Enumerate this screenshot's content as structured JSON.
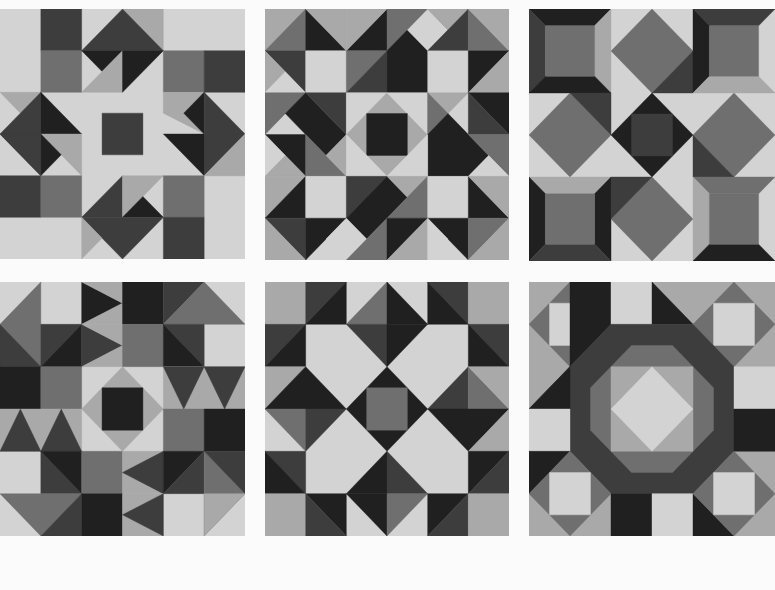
{
  "palette": {
    "light": "#d3d3d3",
    "midlight": "#a9a9a9",
    "mid": "#6f6f6f",
    "dark": "#3d3d3d",
    "darkest": "#202020",
    "page": "#fbfbfb"
  },
  "blocks": [
    {
      "name": "block-1-star-with-pinwheel-arrows",
      "box": {
        "x": 0,
        "y": 9,
        "w": 245,
        "h": 250
      },
      "bg": "light",
      "shapes": [
        [
          "dark",
          "1,0 2,0 2,1 1,1"
        ],
        [
          "mid",
          "1,1 2,1 2,2 1,2"
        ],
        [
          "midlight",
          "3,0 4,0 4,1"
        ],
        [
          "dark",
          "3,0 4,1 2,1"
        ],
        [
          "darkest",
          "2,1 3,1 2.5,1.5"
        ],
        [
          "midlight",
          "2,2 3,1 3,2"
        ],
        [
          "darkest",
          "3,1 4,1 3,2"
        ],
        [
          "mid",
          "4,1 5,1 5,2 4,2"
        ],
        [
          "dark",
          "5,1 6,1 6,2 5,2"
        ],
        [
          "midlight",
          "0,2 1,2 0.5,2.5"
        ],
        [
          "dark",
          "1,2 0,3 1,4"
        ],
        [
          "darkest",
          "1,2 2,3 1,3"
        ],
        [
          "midlight",
          "1,3 2,3 2,4"
        ],
        [
          "darkest",
          "1,3 1.5,3.5 1,4"
        ],
        [
          "dark",
          "0,3 1,3 1,4"
        ],
        [
          "midlight",
          "4,2 5,2 5,3 4,2.5"
        ],
        [
          "darkest",
          "5,2 5,3 4.5,2.5"
        ],
        [
          "dark",
          "5,2 6,3 5,4"
        ],
        [
          "darkest",
          "4,3 5,3 5,4"
        ],
        [
          "midlight",
          "5,4 6,4 5,4"
        ],
        [
          "midlight",
          "5,4 6,3 6,4"
        ],
        [
          "dark",
          "2.5,2.5 3.5,2.5 3.5,3.5 2.5,3.5"
        ],
        [
          "dark",
          "0,4 1,4 1,5 0,5"
        ],
        [
          "mid",
          "1,4 2,4 2,5 1,5"
        ],
        [
          "dark",
          "3,4 2,5 3,5"
        ],
        [
          "midlight",
          "3,4 4,4 3,5"
        ],
        [
          "darkest",
          "3.5,4.5 4,5 3,5"
        ],
        [
          "dark",
          "2,5 4,5 3,6"
        ],
        [
          "midlight",
          "2,5 2.5,5.5 2,6"
        ],
        [
          "mid",
          "4,4 5,4 5,5 4,5"
        ],
        [
          "dark",
          "4,5 5,5 5,6 4,6"
        ]
      ]
    },
    {
      "name": "block-2-diagonal-star",
      "box": {
        "x": 265,
        "y": 9,
        "w": 244,
        "h": 251
      },
      "bg": "light",
      "shapes": [
        [
          "midlight",
          "0,0 1,0 0,1"
        ],
        [
          "mid",
          "0,1 1,0 1,1"
        ],
        [
          "darkest",
          "1,0 2,1 1,1"
        ],
        [
          "midlight",
          "1,0 2,0 2,1"
        ],
        [
          "darkest",
          "2,1 3,0 3,1"
        ],
        [
          "midlight",
          "2,0 3,0 2,1"
        ],
        [
          "mid",
          "3,0 4,0 3,1"
        ],
        [
          "darkest",
          "3,1 4,0 5,1 4,2 3,2"
        ],
        [
          "light",
          "3.5,0.5 4,0 4.5,0.5 4,1"
        ],
        [
          "midlight",
          "4,0 5,0 5,1"
        ],
        [
          "dark",
          "4,1 5,0 5,1"
        ],
        [
          "mid",
          "5,0 6,1 5,1"
        ],
        [
          "midlight",
          "5,0 6,0 6,1"
        ],
        [
          "dark",
          "0,1 1,1 1,2"
        ],
        [
          "midlight",
          "0,1 0.5,1.5 0,2"
        ],
        [
          "light",
          "0,2 0.5,1.5 1,2 0.5,2.5"
        ],
        [
          "light",
          "1,1 2,1 2,2 1,2"
        ],
        [
          "mid",
          "2,1 3,1 2,2"
        ],
        [
          "dark",
          "2,2 3,1 3,2"
        ],
        [
          "light",
          "4,1 5,1 5,2 4,2"
        ],
        [
          "darkest",
          "5,1 6,1 5,2"
        ],
        [
          "midlight",
          "5,2 6,1 6,2"
        ],
        [
          "mid",
          "0,2 1,2 0,3"
        ],
        [
          "darkest",
          "0.5,2.5 1,2 2,3 1.5,3.5 1,3"
        ],
        [
          "dark",
          "1,2 2,2 2,3"
        ],
        [
          "light",
          "2,2 3,2 2,3"
        ],
        [
          "midlight",
          "2,3 3,2 4,3 3,4"
        ],
        [
          "light",
          "3,2 4,2 4,3"
        ],
        [
          "darkest",
          "2.5,2.5 3.5,2.5 3.5,3.5 2.5,3.5"
        ],
        [
          "midlight",
          "4,2 5,2 4,3"
        ],
        [
          "mid",
          "4,2 4.5,2.5 4,3"
        ],
        [
          "darkest",
          "5,2 6,2 6,3"
        ],
        [
          "darkest",
          "4,3 4.5,2.5 5.5,3.5 5,4 4,4"
        ],
        [
          "dark",
          "5,2 6,3 5,3"
        ],
        [
          "mid",
          "5,3 6,3 6,4"
        ],
        [
          "darkest",
          "0,3 1,3 1,4"
        ],
        [
          "light",
          "0,3 0.5,3.5 0,4"
        ],
        [
          "midlight",
          "0,4 0.5,3.5 1,4"
        ],
        [
          "mid",
          "1,3 2,4 1,4"
        ],
        [
          "midlight",
          "1.5,3.5 2,3 2,4"
        ],
        [
          "light",
          "2,3 3,4 2,4"
        ],
        [
          "light",
          "3,4 4,3 4,4"
        ],
        [
          "light",
          "5,4 5.5,3.5 6,4 5.5,4.5"
        ],
        [
          "midlight",
          "0,4 1,4 0,5"
        ],
        [
          "darkest",
          "0,5 1,4 1,5"
        ],
        [
          "light",
          "1,4 2,4 2,5 1,5"
        ],
        [
          "dark",
          "2,4 3,4 2,5"
        ],
        [
          "darkest",
          "2,5 3,4 3.5,4.5 3,5 2.5,5.5"
        ],
        [
          "midlight",
          "3,4 4,4 4,5"
        ],
        [
          "mid",
          "3,5 4,4 4,5"
        ],
        [
          "light",
          "4,4 5,4 5,5 4,5"
        ],
        [
          "darkest",
          "5,4 6,5 5,5"
        ],
        [
          "midlight",
          "5,4 6,4 6,5"
        ],
        [
          "dark",
          "0,5 1,5 1,6"
        ],
        [
          "midlight",
          "0,5 1,6 0,6"
        ],
        [
          "darkest",
          "1,5 2,5 1,6"
        ],
        [
          "light",
          "2,5 2.5,5.5 2,6 1.5,5.5"
        ],
        [
          "mid",
          "2,6 3,5 3,6"
        ],
        [
          "darkest",
          "3,5 4,5 3,6"
        ],
        [
          "midlight",
          "4,5 4,6 3,6"
        ],
        [
          "darkest",
          "4,5 5,5 5,6"
        ],
        [
          "light",
          "4,5 4.5,5.5 4,6"
        ],
        [
          "mid",
          "5,5 6,5 5,6"
        ],
        [
          "midlight",
          "5,6 6,5 6,6"
        ]
      ]
    },
    {
      "name": "block-3-framed-squares-and-diamonds",
      "box": {
        "x": 529,
        "y": 9,
        "w": 246,
        "h": 252
      },
      "bg": "light",
      "shapes": [
        [
          "darkest",
          "0,0 2,0 1.6,0.4 0.4,0.4"
        ],
        [
          "dark",
          "0,0 0.4,0.4 0.4,1.6 0,2"
        ],
        [
          "midlight",
          "2,0 2,2 1.6,1.6 1.6,0.4"
        ],
        [
          "darkest",
          "0,2 0.4,1.6 1.6,1.6 2,2"
        ],
        [
          "mid",
          "0.4,0.4 1.6,0.4 1.6,1.6 0.4,1.6"
        ],
        [
          "mid",
          "3,0 4,1 3,2 2,1"
        ],
        [
          "dark",
          "3,2 4,1 4,2"
        ],
        [
          "dark",
          "4,0 6,0 5.6,0.4 4.4,0.4"
        ],
        [
          "darkest",
          "4,0 4.4,0.4 4.4,1.6 4,2"
        ],
        [
          "midlight",
          "4,2 4.4,1.6 5.6,1.6 6,2"
        ],
        [
          "mid",
          "4.4,0.4 5.6,0.4 5.6,1.6 4.4,1.6"
        ],
        [
          "mid",
          "1,2 2,3 1,4 0,3"
        ],
        [
          "dark",
          "1,2 2,2 2,3"
        ],
        [
          "darkest",
          "3,2 4,3 3,4 2,3"
        ],
        [
          "dark",
          "2.5,2.5 3.5,2.5 3.5,3.5 2.5,3.5"
        ],
        [
          "mid",
          "5,2 6,3 5,4 4,3"
        ],
        [
          "dark",
          "4,3 5,4 4,4"
        ],
        [
          "midlight",
          "0,4 2,4 1.6,4.4 0.4,4.4"
        ],
        [
          "darkest",
          "0,4 0.4,4.4 0.4,5.6 0,6"
        ],
        [
          "darkest",
          "2,4 2,6 1.6,5.6 1.6,4.4"
        ],
        [
          "dark",
          "0,6 0.4,5.6 1.6,5.6 2,6"
        ],
        [
          "mid",
          "0.4,4.4 1.6,4.4 1.6,5.6 0.4,5.6"
        ],
        [
          "mid",
          "3,4 4,5 3,6 2,5"
        ],
        [
          "dark",
          "2,4 3,4 2,5"
        ],
        [
          "mid",
          "4,4 6,4 5.6,4.4 4.4,4.4"
        ],
        [
          "midlight",
          "4,4 4.4,4.4 4.4,5.6 4,6"
        ],
        [
          "darkest",
          "4,6 4.4,5.6 5.6,5.6 6,6"
        ],
        [
          "mid",
          "4.4,4.4 5.6,4.4 5.6,5.6 4.4,5.6"
        ]
      ]
    },
    {
      "name": "block-4-flying-geese-sampler",
      "box": {
        "x": 0,
        "y": 282,
        "w": 245,
        "h": 254
      },
      "bg": "light",
      "shapes": [
        [
          "mid",
          "1,0 0,1 1,2"
        ],
        [
          "darkest",
          "2,0 3,0.5 2,1"
        ],
        [
          "midlight",
          "2,0 3,0 3,0.5"
        ],
        [
          "midlight",
          "2,1 3,0.5 3,1"
        ],
        [
          "darkest",
          "3,0 4,0 4,1 3,1"
        ],
        [
          "dark",
          "4,0 5,0 4,1"
        ],
        [
          "mid",
          "4,1 5,0 6,1"
        ],
        [
          "dark",
          "0,1 1,2 0,2"
        ],
        [
          "dark",
          "1,1 2,1 1,2"
        ],
        [
          "darkest",
          "1,2 2,1 2,2"
        ],
        [
          "dark",
          "2,1 3,1.5 2,2"
        ],
        [
          "midlight",
          "2,1 3,1 3,1.5"
        ],
        [
          "midlight",
          "2,2 3,1.5 3,2"
        ],
        [
          "mid",
          "3,1 4,1 4,2 3,2"
        ],
        [
          "dark",
          "4,1 5,1 5,2"
        ],
        [
          "darkest",
          "4,1 5,2 4,2"
        ],
        [
          "darkest",
          "0,2 1,2 1,3 0,3"
        ],
        [
          "mid",
          "1,2 2,2 2,3 1,3"
        ],
        [
          "midlight",
          "2.5,2.5 3,2 4,3 3,4 2,3"
        ],
        [
          "darkest",
          "2.5,2.5 3.5,2.5 3.5,3.5 2.5,3.5"
        ],
        [
          "midlight",
          "4,2 6,2 6,3 4,3"
        ],
        [
          "dark",
          "4,2 5,2 4.5,3"
        ],
        [
          "dark",
          "5,2 6,2 5.5,3"
        ],
        [
          "midlight",
          "0,3 2,3 2,4 0,4"
        ],
        [
          "dark",
          "0.5,3 1,4 0,4"
        ],
        [
          "dark",
          "1.5,3 2,4 1,4"
        ],
        [
          "mid",
          "4,3 5,3 5,4 4,4"
        ],
        [
          "darkest",
          "5,3 6,3 6,4 5,4"
        ],
        [
          "dark",
          "1,4 2,5 1,5"
        ],
        [
          "darkest",
          "1,4 2,4 2,5"
        ],
        [
          "mid",
          "2,4 3,4 3,5 2,5"
        ],
        [
          "midlight",
          "3,4 4,4 4,5 3,5"
        ],
        [
          "dark",
          "3,4.5 4,4 4,5"
        ],
        [
          "darkest",
          "4,4 5,4 4,5"
        ],
        [
          "dark",
          "4,5 5,4 5,5"
        ],
        [
          "mid",
          "5,4 6,5 5,6"
        ],
        [
          "dark",
          "5,4 6,4 6,5"
        ],
        [
          "mid",
          "0,5 2,5 1,6"
        ],
        [
          "dark",
          "2,5 1,6 2,6"
        ],
        [
          "darkest",
          "2,5 3,5 3,6 2,6"
        ],
        [
          "midlight",
          "3,5 4,5 4,6 3,6"
        ],
        [
          "dark",
          "3,5.5 4,5 4,6"
        ],
        [
          "midlight",
          "5,5 6,5 5,6"
        ]
      ]
    },
    {
      "name": "block-5-crown-star",
      "box": {
        "x": 265,
        "y": 282,
        "w": 244,
        "h": 254
      },
      "bg": "light",
      "shapes": [
        [
          "midlight",
          "0,0 1,0 1,1 0,1"
        ],
        [
          "dark",
          "1,0 2,0 1,1"
        ],
        [
          "darkest",
          "1,1 2,0 2,1"
        ],
        [
          "mid",
          "3,0 2,1 3,1"
        ],
        [
          "darkest",
          "3,0 4,1 3,1"
        ],
        [
          "dark",
          "2,1 3,1 3,2"
        ],
        [
          "darkest",
          "3,1 4,1 3,2"
        ],
        [
          "dark",
          "4,0 5,0 5,1"
        ],
        [
          "darkest",
          "4,0 5,1 4,1"
        ],
        [
          "midlight",
          "5,0 6,0 6,1 5,1"
        ],
        [
          "dark",
          "0,1 1,1 0,2"
        ],
        [
          "darkest",
          "0,2 1,1 1,2"
        ],
        [
          "dark",
          "5,1 6,1 6,2"
        ],
        [
          "darkest",
          "5,1 6,2 5,2"
        ],
        [
          "midlight",
          "0,2 1,2 0,3"
        ],
        [
          "darkest",
          "1,2 2,3 0,3"
        ],
        [
          "darkest",
          "3,2 4,3 3,4 2,3"
        ],
        [
          "mid",
          "2.5,2.5 3.5,2.5 3.5,3.5 2.5,3.5"
        ],
        [
          "dark",
          "5,2 4,3 5,3"
        ],
        [
          "mid",
          "5,2 6,3 5,3"
        ],
        [
          "midlight",
          "5,2 6,2 6,3"
        ],
        [
          "mid",
          "0,3 1,3 1,4"
        ],
        [
          "dark",
          "1,3 2,3 1,4"
        ],
        [
          "darkest",
          "4,3 6,3 5,4"
        ],
        [
          "midlight",
          "5,4 6,3 6,4"
        ],
        [
          "dark",
          "0,4 1,4 1,5"
        ],
        [
          "darkest",
          "0,4 1,5 0,5"
        ],
        [
          "darkest",
          "3,4 2,5 3,5"
        ],
        [
          "dark",
          "3,4 4,5 3,5"
        ],
        [
          "darkest",
          "2,5 3,5 3,6"
        ],
        [
          "mid",
          "3,5 4,5 3,6"
        ],
        [
          "darkest",
          "5,4 6,4 5,5"
        ],
        [
          "dark",
          "5,5 6,4 6,5"
        ],
        [
          "midlight",
          "0,5 1,5 1,6 0,6"
        ],
        [
          "darkest",
          "1,5 2,5 2,6"
        ],
        [
          "dark",
          "1,5 2,6 1,6"
        ],
        [
          "darkest",
          "4,5 5,5 4,6"
        ],
        [
          "dark",
          "4,6 5,5 5,6"
        ],
        [
          "midlight",
          "5,5 6,5 6,6 5,6"
        ]
      ]
    },
    {
      "name": "block-6-octagon-ring",
      "box": {
        "x": 529,
        "y": 282,
        "w": 246,
        "h": 254
      },
      "bg": "midlight",
      "shapes": [
        [
          "mid",
          "1,0 2,1 1,2 0,1"
        ],
        [
          "light",
          "0.5,0.5 1.5,0.5 1.5,1.5 0.5,1.5"
        ],
        [
          "darkest",
          "1,0 2,0 2,1 1.5,1.5 0,3 0.5,2.5 1,2"
        ],
        [
          "light",
          "2,0 3,0 3,1 2,1"
        ],
        [
          "darkest",
          "3,0 4,1 3,1"
        ],
        [
          "mid",
          "5,0 6,1 5,2 4,1"
        ],
        [
          "light",
          "4.5,0.5 5.5,0.5 5.5,1.5 4.5,1.5"
        ],
        [
          "dark",
          "1,2 2,1 4,1 5,2 5,4 4,5 2,5 1,4"
        ],
        [
          "mid",
          "1.5,2.5 2.5,1.5 3.5,1.5 4.5,2.5 4.5,3.5 3.5,4.5 2.5,4.5 1.5,3.5"
        ],
        [
          "midlight",
          "2,2 4,2 4,4 2,4"
        ],
        [
          "light",
          "3,2 4,3 3,4 2,3"
        ],
        [
          "darkest",
          "0,3 1,2 1,3"
        ],
        [
          "light",
          "0,3 1,3 1,4 0,4"
        ],
        [
          "light",
          "5,2 6,2 6,3 5,3"
        ],
        [
          "darkest",
          "5,3 6,3 6,4 5,4"
        ],
        [
          "darkest",
          "0,4 1,4 0,5"
        ],
        [
          "mid",
          "1,4 2,5 1,6 0,5"
        ],
        [
          "light",
          "0.5,4.5 1.5,4.5 1.5,5.5 0.5,5.5"
        ],
        [
          "darkest",
          "2,5 3,5 3,6 2,6"
        ],
        [
          "light",
          "3,5 4,5 4,6 3,6"
        ],
        [
          "darkest",
          "4,5 5,6 4,6"
        ],
        [
          "mid",
          "5,4 6,5 5,6 4,5"
        ],
        [
          "light",
          "4.5,4.5 5.5,4.5 5.5,5.5 4.5,5.5"
        ]
      ]
    }
  ]
}
